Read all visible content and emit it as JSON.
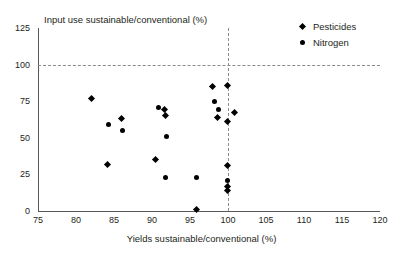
{
  "chart_data": {
    "type": "scatter",
    "title": "",
    "xlabel": "Yields sustainable/conventional (%)",
    "ylabel": "Input use sustainable/conventional (%)",
    "xlim": [
      75,
      120
    ],
    "ylim": [
      0,
      125
    ],
    "xticks": [
      75,
      80,
      85,
      90,
      95,
      100,
      105,
      110,
      115,
      120
    ],
    "yticks": [
      0,
      25,
      50,
      75,
      100,
      125
    ],
    "grid": "reference-lines-only",
    "reference_lines": [
      {
        "axis": "y",
        "value": 100,
        "style": "dashed"
      },
      {
        "axis": "x",
        "value": 100,
        "style": "dashed"
      }
    ],
    "legend_position": "top-right",
    "series": [
      {
        "name": "Pesticides",
        "marker": "diamond",
        "color": "#000000",
        "points": [
          {
            "x": 82.0,
            "y": 77
          },
          {
            "x": 86.0,
            "y": 63
          },
          {
            "x": 84.2,
            "y": 32
          },
          {
            "x": 91.6,
            "y": 69
          },
          {
            "x": 91.8,
            "y": 65
          },
          {
            "x": 90.4,
            "y": 35
          },
          {
            "x": 98.0,
            "y": 85
          },
          {
            "x": 98.6,
            "y": 64
          },
          {
            "x": 99.9,
            "y": 86
          },
          {
            "x": 99.9,
            "y": 61
          },
          {
            "x": 100.9,
            "y": 67
          },
          {
            "x": 99.9,
            "y": 31
          },
          {
            "x": 99.9,
            "y": 17
          },
          {
            "x": 99.9,
            "y": 14
          },
          {
            "x": 95.9,
            "y": 1
          }
        ]
      },
      {
        "name": "Nitrogen",
        "marker": "circle",
        "color": "#000000",
        "points": [
          {
            "x": 84.3,
            "y": 59
          },
          {
            "x": 86.1,
            "y": 55
          },
          {
            "x": 90.9,
            "y": 71
          },
          {
            "x": 91.9,
            "y": 51
          },
          {
            "x": 91.8,
            "y": 23
          },
          {
            "x": 95.8,
            "y": 23
          },
          {
            "x": 98.2,
            "y": 75
          },
          {
            "x": 98.7,
            "y": 69
          },
          {
            "x": 99.9,
            "y": 21
          }
        ]
      }
    ]
  },
  "legend": {
    "items": [
      {
        "label": "Pesticides",
        "marker": "diamond"
      },
      {
        "label": "Nitrogen",
        "marker": "circle"
      }
    ]
  }
}
